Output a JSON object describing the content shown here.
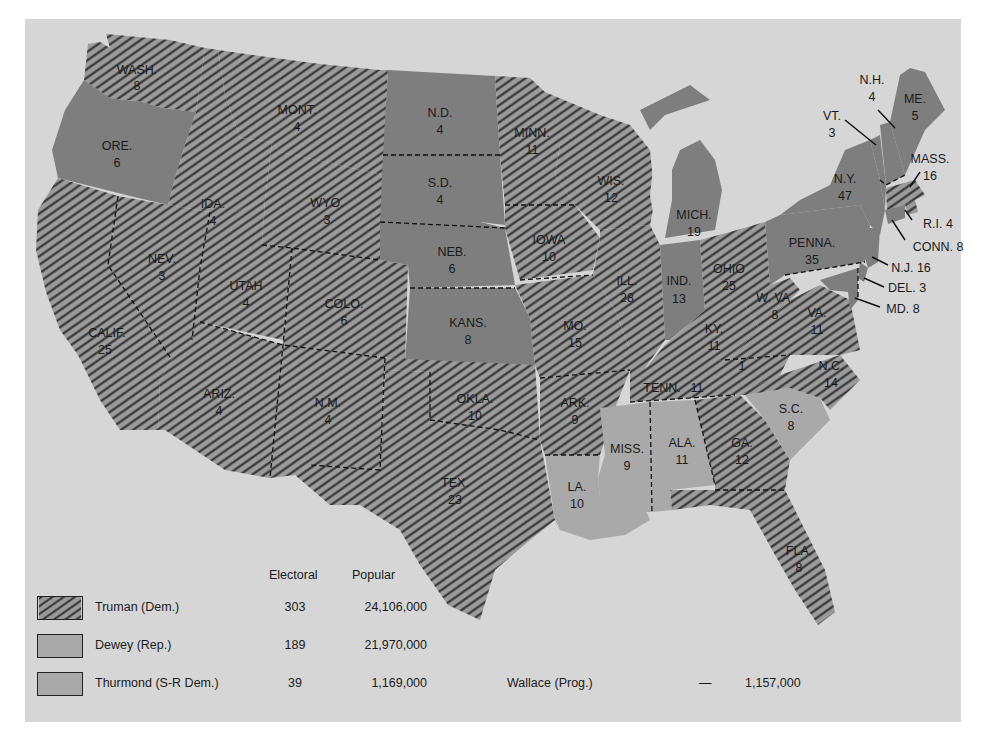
{
  "colors": {
    "background": "#d6d6d6",
    "truman_fill": "#9b9b9b",
    "truman_hatch": "#2a2a2a",
    "dewey": "#7e7e7e",
    "thurmond": "#a9a9a9"
  },
  "legend": {
    "headers": {
      "electoral": "Electoral",
      "popular": "Popular"
    },
    "rows": [
      {
        "party": "truman",
        "label": "Truman (Dem.)",
        "electoral": "303",
        "popular": "24,106,000"
      },
      {
        "party": "dewey",
        "label": "Dewey (Rep.)",
        "electoral": "189",
        "popular": "21,970,000"
      },
      {
        "party": "thurmond",
        "label": "Thurmond (S-R Dem.)",
        "electoral": "39",
        "popular": "1,169,000"
      }
    ],
    "wallace": {
      "label": "Wallace (Prog.)",
      "electoral": "—",
      "popular": "1,157,000"
    }
  },
  "states": {
    "wash": {
      "abbr": "WASH.",
      "ev": "8",
      "winner": "truman"
    },
    "ore": {
      "abbr": "ORE.",
      "ev": "6",
      "winner": "dewey"
    },
    "calif": {
      "abbr": "CALIF.",
      "ev": "25",
      "winner": "truman"
    },
    "ida": {
      "abbr": "IDA.",
      "ev": "4",
      "winner": "truman"
    },
    "nev": {
      "abbr": "NEV.",
      "ev": "3",
      "winner": "truman"
    },
    "mont": {
      "abbr": "MONT.",
      "ev": "4",
      "winner": "truman"
    },
    "wyo": {
      "abbr": "WYO.",
      "ev": "3",
      "winner": "truman"
    },
    "utah": {
      "abbr": "UTAH",
      "ev": "4",
      "winner": "truman"
    },
    "colo": {
      "abbr": "COLO.",
      "ev": "6",
      "winner": "truman"
    },
    "ariz": {
      "abbr": "ARIZ.",
      "ev": "4",
      "winner": "truman"
    },
    "nm": {
      "abbr": "N.M.",
      "ev": "4",
      "winner": "truman"
    },
    "nd": {
      "abbr": "N.D.",
      "ev": "4",
      "winner": "dewey"
    },
    "sd": {
      "abbr": "S.D.",
      "ev": "4",
      "winner": "dewey"
    },
    "neb": {
      "abbr": "NEB.",
      "ev": "6",
      "winner": "dewey"
    },
    "kans": {
      "abbr": "KANS.",
      "ev": "8",
      "winner": "dewey"
    },
    "okla": {
      "abbr": "OKLA.",
      "ev": "10",
      "winner": "truman"
    },
    "tex": {
      "abbr": "TEX.",
      "ev": "23",
      "winner": "truman"
    },
    "minn": {
      "abbr": "MINN.",
      "ev": "11",
      "winner": "truman"
    },
    "iowa": {
      "abbr": "IOWA",
      "ev": "10",
      "winner": "truman"
    },
    "mo": {
      "abbr": "MO.",
      "ev": "15",
      "winner": "truman"
    },
    "ark": {
      "abbr": "ARK.",
      "ev": "9",
      "winner": "truman"
    },
    "la": {
      "abbr": "LA.",
      "ev": "10",
      "winner": "thurmond"
    },
    "wis": {
      "abbr": "WIS.",
      "ev": "12",
      "winner": "truman"
    },
    "ill": {
      "abbr": "ILL.",
      "ev": "28",
      "winner": "truman"
    },
    "mich": {
      "abbr": "MICH.",
      "ev": "19",
      "winner": "dewey"
    },
    "ind": {
      "abbr": "IND.",
      "ev": "13",
      "winner": "dewey"
    },
    "ohio": {
      "abbr": "OHIO",
      "ev": "25",
      "winner": "truman"
    },
    "ky": {
      "abbr": "KY.",
      "ev": "11",
      "winner": "truman"
    },
    "tenn": {
      "abbr": "TENN.",
      "ev": "11",
      "winner": "truman",
      "split_note": "1"
    },
    "miss": {
      "abbr": "MISS.",
      "ev": "9",
      "winner": "thurmond"
    },
    "ala": {
      "abbr": "ALA.",
      "ev": "11",
      "winner": "thurmond"
    },
    "ga": {
      "abbr": "GA.",
      "ev": "12",
      "winner": "truman"
    },
    "fla": {
      "abbr": "FLA.",
      "ev": "8",
      "winner": "truman"
    },
    "sc": {
      "abbr": "S.C.",
      "ev": "8",
      "winner": "thurmond"
    },
    "nc": {
      "abbr": "N.C.",
      "ev": "14",
      "winner": "truman"
    },
    "va": {
      "abbr": "VA.",
      "ev": "11",
      "winner": "truman"
    },
    "wva": {
      "abbr": "W. VA.",
      "ev": "8",
      "winner": "truman"
    },
    "penna": {
      "abbr": "PENNA.",
      "ev": "35",
      "winner": "dewey"
    },
    "ny": {
      "abbr": "N.Y.",
      "ev": "47",
      "winner": "dewey"
    },
    "vt": {
      "abbr": "VT.",
      "ev": "3",
      "winner": "dewey"
    },
    "nh": {
      "abbr": "N.H.",
      "ev": "4",
      "winner": "dewey"
    },
    "me": {
      "abbr": "ME.",
      "ev": "5",
      "winner": "dewey"
    },
    "mass": {
      "abbr": "MASS.",
      "ev": "16",
      "winner": "truman"
    },
    "ri": {
      "abbr": "R.I.",
      "ev": "4",
      "winner": "truman",
      "label": "R.I. 4"
    },
    "conn": {
      "abbr": "CONN.",
      "ev": "8",
      "winner": "dewey",
      "label": "CONN. 8"
    },
    "nj": {
      "abbr": "N.J.",
      "ev": "16",
      "winner": "dewey",
      "label": "N.J. 16"
    },
    "del": {
      "abbr": "DEL.",
      "ev": "3",
      "winner": "dewey",
      "label": "DEL. 3"
    },
    "md": {
      "abbr": "MD.",
      "ev": "8",
      "winner": "dewey",
      "label": "MD. 8"
    }
  }
}
